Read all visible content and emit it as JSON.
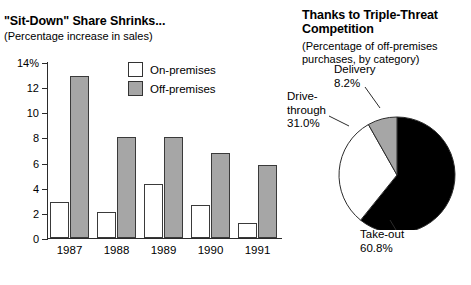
{
  "bar_panel": {
    "title": "\"Sit-Down\" Share Shrinks...",
    "subtitle": "(Percentage increase in sales)",
    "legend": [
      {
        "label": "On-premises",
        "swatch": "white-square-icon"
      },
      {
        "label": "Off-premises",
        "swatch": "gray-square-icon"
      }
    ]
  },
  "pie_panel": {
    "title": "Thanks to Triple-Threat Competition",
    "subtitle": "(Percentage of off-premises purchases, by category)",
    "labels": {
      "delivery": "Delivery\n8.2%",
      "delivery_name": "Delivery",
      "delivery_value": "8.2%",
      "drive_name": "Drive-\nthrough",
      "drive_value": "31.0%",
      "takeout_name": "Take-out",
      "takeout_value": "60.8%"
    }
  },
  "chart_data": [
    {
      "type": "bar",
      "title": "\"Sit-Down\" Share Shrinks...",
      "subtitle": "(Percentage increase in sales)",
      "xlabel": "",
      "ylabel": "",
      "ylim": [
        0,
        14
      ],
      "yticks": [
        0,
        2,
        4,
        6,
        8,
        10,
        12,
        14
      ],
      "ytick_labels": [
        "0",
        "2",
        "4",
        "6",
        "8",
        "10",
        "12",
        "14%"
      ],
      "grid": false,
      "legend_position": "top-right",
      "categories": [
        "1987",
        "1988",
        "1989",
        "1990",
        "1991"
      ],
      "series": [
        {
          "name": "On-premises",
          "color": "#ffffff",
          "values": [
            2.9,
            2.1,
            4.3,
            2.6,
            1.2
          ]
        },
        {
          "name": "Off-premises",
          "color": "#a6a6a6",
          "values": [
            12.9,
            8.0,
            8.0,
            6.8,
            5.8
          ]
        }
      ]
    },
    {
      "type": "pie",
      "title": "Thanks to Triple-Threat Competition",
      "subtitle": "(Percentage of off-premises purchases, by category)",
      "labels": [
        "Take-out",
        "Drive-through",
        "Delivery"
      ],
      "values": [
        60.8,
        31.0,
        8.2
      ],
      "value_labels": [
        "60.8%",
        "31.0%",
        "8.2%"
      ],
      "colors": [
        "#000000",
        "#ffffff",
        "#a6a6a6"
      ],
      "legend_position": "callout-labels"
    }
  ],
  "colors": {
    "off_premises_gray": "#a6a6a6",
    "on_premises_white": "#ffffff",
    "takeout_black": "#000000",
    "axis": "#2b2b2b",
    "background": "#ffffff"
  }
}
